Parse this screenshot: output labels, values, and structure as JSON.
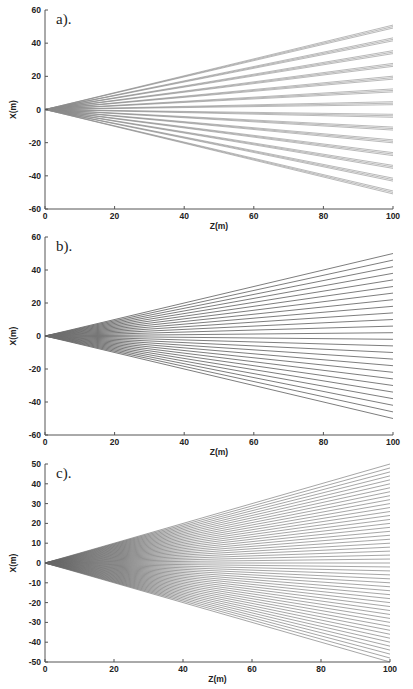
{
  "chart_data": [
    {
      "type": "line",
      "panel_label": "a).",
      "title": "",
      "xlabel": "Z(m)",
      "ylabel": "X(m)",
      "xlim": [
        0,
        100
      ],
      "ylim": [
        -60,
        60
      ],
      "xticks": [
        0,
        20,
        40,
        60,
        80,
        100
      ],
      "yticks": [
        60,
        40,
        20,
        0,
        -20,
        -40,
        -60
      ],
      "grid": false,
      "legend": null,
      "description": "Fan of ray bundles from origin; 14 bundles of ~3 closely spaced lines each",
      "series_description": "X = slope * Z, Z from 0 to 100",
      "bundle_lines": 3,
      "bundle_spread": 0.9,
      "end_values_at_z100": [
        50,
        42.3,
        34.6,
        26.9,
        19.2,
        11.5,
        3.8,
        -3.8,
        -11.5,
        -19.2,
        -26.9,
        -34.6,
        -42.3,
        -50
      ],
      "line_color": "#8a8a8a",
      "shade_near_origin": [
        0,
        15
      ]
    },
    {
      "type": "line",
      "panel_label": "b).",
      "title": "",
      "xlabel": "Z(m)",
      "ylabel": "X(m)",
      "xlim": [
        0,
        100
      ],
      "ylim": [
        -60,
        60
      ],
      "xticks": [
        0,
        20,
        40,
        60,
        80,
        100
      ],
      "yticks": [
        60,
        40,
        20,
        0,
        -20,
        -40,
        -60
      ],
      "grid": false,
      "legend": null,
      "description": "Fan of 26 rays from origin, evenly spaced",
      "bundle_lines": 1,
      "bundle_spread": 0,
      "end_values_at_z100": [
        50,
        46,
        42,
        38,
        34,
        30,
        26,
        22,
        18,
        14,
        10,
        6,
        2,
        -2,
        -6,
        -10,
        -14,
        -18,
        -22,
        -26,
        -30,
        -34,
        -38,
        -42,
        -46,
        -50
      ],
      "line_color": "#6e6e6e",
      "shade_near_origin": [
        0,
        30
      ]
    },
    {
      "type": "line",
      "panel_label": "c).",
      "title": "",
      "xlabel": "Z(m)",
      "ylabel": "X(m)",
      "xlim": [
        0,
        100
      ],
      "ylim": [
        -50,
        50
      ],
      "xticks": [
        0,
        20,
        40,
        60,
        80,
        100
      ],
      "yticks": [
        50,
        40,
        30,
        20,
        10,
        0,
        -10,
        -20,
        -30,
        -40,
        -50
      ],
      "grid": false,
      "legend": null,
      "description": "Fan of ~50 rays from origin, evenly spaced",
      "bundle_lines": 1,
      "bundle_spread": 0,
      "end_values_at_z100": [
        50,
        48,
        46,
        44,
        42,
        40,
        38,
        36,
        34,
        32,
        30,
        28,
        26,
        24,
        22,
        20,
        18,
        16,
        14,
        12,
        10,
        8,
        6,
        4,
        2,
        0,
        -2,
        -4,
        -6,
        -8,
        -10,
        -12,
        -14,
        -16,
        -18,
        -20,
        -22,
        -24,
        -26,
        -28,
        -30,
        -32,
        -34,
        -36,
        -38,
        -40,
        -42,
        -44,
        -46,
        -48,
        -50
      ],
      "line_color": "#6a6a6a",
      "shade_near_origin": [
        0,
        45
      ]
    }
  ],
  "layout": {
    "panels": [
      {
        "left": 45,
        "right": 393,
        "top": 10,
        "bottom": 209
      },
      {
        "left": 45,
        "right": 393,
        "top": 237,
        "bottom": 435
      },
      {
        "left": 45,
        "right": 390,
        "top": 464,
        "bottom": 662
      }
    ]
  }
}
